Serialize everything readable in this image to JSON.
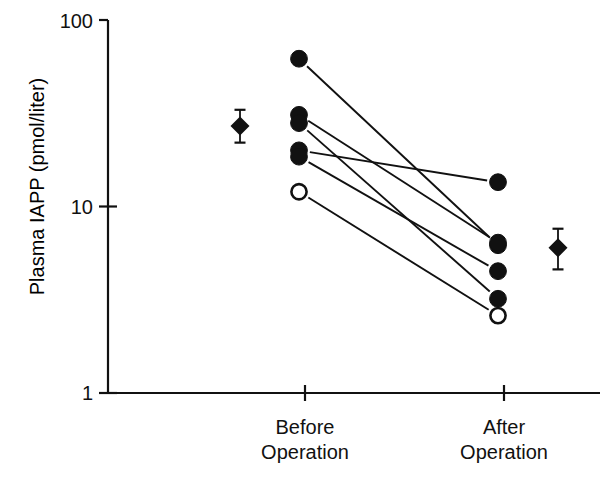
{
  "chart_data": {
    "type": "scatter",
    "title": "",
    "xlabel": "",
    "ylabel": "Plasma IAPP (pmol/liter)",
    "yscale": "log",
    "ylim": [
      1,
      100
    ],
    "ytick_labels": [
      "100",
      "10",
      "1"
    ],
    "ytick_values": [
      100,
      10,
      1
    ],
    "grid": false,
    "legend": false,
    "categories": [
      "Before Operation",
      "After Operation"
    ],
    "category_labels": [
      {
        "line1": "Before",
        "line2": "Operation"
      },
      {
        "line1": "After",
        "line2": "Operation"
      }
    ],
    "series": [
      {
        "name": "paired-subjects",
        "marker_types": [
          "filled-circle",
          "open-circle"
        ],
        "pairs": [
          {
            "id": "s1",
            "marker": "filled-circle",
            "before": 62.0,
            "after": 6.2
          },
          {
            "id": "s2",
            "marker": "filled-circle",
            "before": 31.0,
            "after": 6.4
          },
          {
            "id": "s3",
            "marker": "filled-circle",
            "before": 28.0,
            "after": 3.2
          },
          {
            "id": "s4",
            "marker": "filled-circle",
            "before": 20.0,
            "after": 13.5
          },
          {
            "id": "s5",
            "marker": "filled-circle",
            "before": 18.5,
            "after": 4.5
          },
          {
            "id": "s6",
            "marker": "open-circle",
            "before": 12.0,
            "after": 2.6
          }
        ]
      },
      {
        "name": "group-mean",
        "marker_types": [
          "filled-diamond"
        ],
        "points": [
          {
            "category": "Before Operation",
            "mean": 27.0,
            "error_high": 33.0,
            "error_low": 22.0
          },
          {
            "category": "After Operation",
            "mean": 6.0,
            "error_high": 7.6,
            "error_low": 4.6
          }
        ]
      }
    ],
    "annotations": []
  },
  "figure": {
    "colors": {
      "foreground": "#111111",
      "background": "#ffffff",
      "marker_fill": "#111111",
      "marker_open_fill": "#ffffff"
    }
  }
}
